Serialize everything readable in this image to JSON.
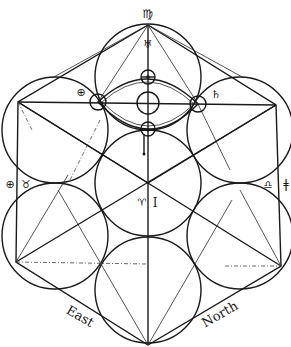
{
  "diagram": {
    "type": "geometric-astrological-diagram",
    "colors": {
      "ink": "#1a1a1a",
      "background": "#ffffff"
    },
    "labels": {
      "top_sign": "♍",
      "top_glyph": "♅",
      "left_glyph": "⊕",
      "left_sign_earth": "⊕",
      "left_sign_taurus": "♉",
      "right_glyph": "♄",
      "right_sign_libra": "♎",
      "right_mark": "ǂ",
      "center_left_glyph": "♈",
      "center_right_glyph": "I",
      "east": "East",
      "north": "North"
    },
    "circles": [
      {
        "name": "top",
        "cx": 148,
        "cy": 77,
        "r": 53
      },
      {
        "name": "upper-left",
        "cx": 55,
        "cy": 130,
        "r": 53
      },
      {
        "name": "upper-right",
        "cx": 240,
        "cy": 130,
        "r": 53
      },
      {
        "name": "center",
        "cx": 148,
        "cy": 183,
        "r": 53
      },
      {
        "name": "lower-left",
        "cx": 55,
        "cy": 235,
        "r": 53
      },
      {
        "name": "lower-right",
        "cx": 240,
        "cy": 235,
        "r": 53
      },
      {
        "name": "bottom",
        "cx": 148,
        "cy": 290,
        "r": 53
      }
    ]
  }
}
